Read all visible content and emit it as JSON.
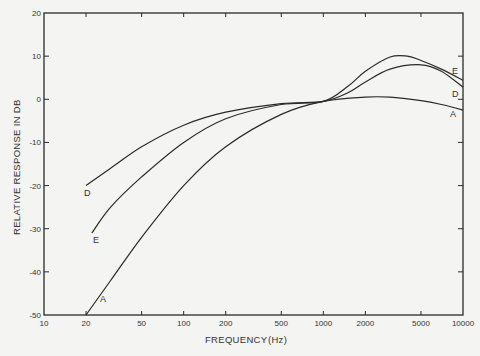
{
  "chart_data": {
    "type": "line",
    "title": "",
    "xlabel": "FREQUENCY",
    "xunit": "(Hz)",
    "ylabel": "RELATIVE RESPONSE IN DB",
    "xscale": "log",
    "xlim": [
      10,
      10000
    ],
    "ylim": [
      -50,
      20
    ],
    "grid": false,
    "legend": "inline curve labels",
    "x_ticks": [
      10,
      20,
      50,
      100,
      200,
      500,
      1000,
      2000,
      5000,
      10000
    ],
    "x_tick_labels": [
      "10",
      "20",
      "50",
      "100",
      "200",
      "500",
      "1000",
      "2000",
      "5000",
      "10000"
    ],
    "y_ticks": [
      20,
      10,
      0,
      -10,
      -20,
      -30,
      -40,
      -50
    ],
    "y_tick_labels": [
      "20",
      "10",
      "0",
      "-10",
      "-20",
      "-30",
      "-40",
      "-50"
    ],
    "series": [
      {
        "name": "A",
        "x": [
          20,
          30,
          50,
          100,
          200,
          500,
          1000,
          2000,
          3000,
          5000,
          7000,
          10000
        ],
        "y": [
          -50,
          -42,
          -32,
          -20,
          -11,
          -3.5,
          -0.5,
          0.5,
          0.5,
          -0.3,
          -1.2,
          -2.5
        ]
      },
      {
        "name": "D",
        "x": [
          20,
          30,
          50,
          100,
          200,
          500,
          1000,
          1500,
          2000,
          3000,
          5000,
          7000,
          10000
        ],
        "y": [
          -20,
          -16,
          -11,
          -6,
          -3,
          -1,
          -0.5,
          1.5,
          4,
          7,
          8,
          6.5,
          2.8
        ]
      },
      {
        "name": "E",
        "x": [
          22,
          30,
          50,
          100,
          200,
          500,
          1000,
          1500,
          2000,
          3000,
          4000,
          5000,
          7000,
          10000
        ],
        "y": [
          -31,
          -25,
          -18,
          -10,
          -4.5,
          -1.2,
          -0.5,
          3,
          6.5,
          9.8,
          10,
          9,
          7,
          4.4
        ]
      }
    ]
  },
  "curve_labels": {
    "A_left": "A",
    "D_left": "D",
    "E_left": "E",
    "A_right": "A",
    "D_right": "D",
    "E_right": "E"
  },
  "axes": {
    "x_title": "FREQUENCY",
    "x_unit": "(Hz)",
    "y_title": "RELATIVE RESPONSE IN DB"
  }
}
